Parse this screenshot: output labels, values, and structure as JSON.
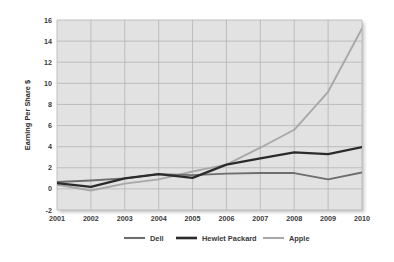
{
  "chart_data": {
    "type": "line",
    "title": "",
    "xlabel": "",
    "ylabel": "Earning Per Share $",
    "categories": [
      "2001",
      "2002",
      "2003",
      "2004",
      "2005",
      "2006",
      "2007",
      "2008",
      "2009",
      "2010"
    ],
    "x": [
      2001,
      2002,
      2003,
      2004,
      2005,
      2006,
      2007,
      2008,
      2009,
      2010
    ],
    "xlim": [
      2001,
      2010
    ],
    "ylim": [
      -2,
      16
    ],
    "yticks": [
      -2,
      0,
      2,
      4,
      6,
      8,
      10,
      12,
      14,
      16
    ],
    "ytick_labels": [
      "-2",
      "0",
      "2",
      "4",
      "6",
      "8",
      "10",
      "12",
      "14",
      "16"
    ],
    "grid": true,
    "legend_position": "bottom",
    "series": [
      {
        "name": "Dell",
        "color": "#6e6e6e",
        "values": [
          0.65,
          0.8,
          1.0,
          1.4,
          1.3,
          1.45,
          1.5,
          1.5,
          0.9,
          1.55
        ]
      },
      {
        "name": "Hewlet Packard",
        "color": "#2b2b2b",
        "values": [
          0.55,
          0.2,
          1.0,
          1.4,
          1.05,
          2.3,
          2.9,
          3.45,
          3.3,
          3.95
        ]
      },
      {
        "name": "Apple",
        "color": "#a8a8a8",
        "values": [
          0.4,
          -0.15,
          0.5,
          0.9,
          1.65,
          2.3,
          3.9,
          5.6,
          9.2,
          15.2
        ]
      }
    ]
  },
  "legend": {
    "items": [
      {
        "label": "Dell",
        "color": "#6e6e6e"
      },
      {
        "label": "Hewlet Packard",
        "color": "#2b2b2b"
      },
      {
        "label": "Apple",
        "color": "#a8a8a8"
      }
    ]
  },
  "axes": {
    "y_title": "Earning Per Share $",
    "y_tick_labels": [
      "16",
      "14",
      "12",
      "10",
      "8",
      "6",
      "4",
      "2",
      "0",
      "-2"
    ],
    "x_tick_labels": [
      "2001",
      "2002",
      "2003",
      "2004",
      "2005",
      "2006",
      "2007",
      "2008",
      "2009",
      "2010"
    ]
  },
  "colors": {
    "plot_background": "#e2e2e2",
    "gridline": "#b4b4b4",
    "page_background": "#ffffff",
    "tick_label": "#3a3a3a"
  }
}
